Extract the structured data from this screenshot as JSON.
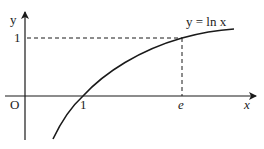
{
  "diagram": {
    "curve_label": "y = ln x",
    "axes": {
      "x_label": "x",
      "y_label": "y",
      "origin_label": "O"
    },
    "ticks": {
      "x_one": "1",
      "x_e": "e",
      "y_one": "1"
    },
    "colors": {
      "stroke": "#1a1a1a",
      "background": "#ffffff"
    }
  }
}
